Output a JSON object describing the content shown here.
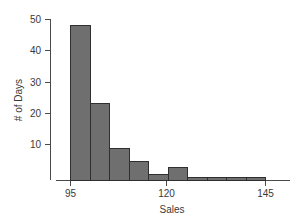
{
  "chart_data": {
    "type": "bar",
    "title": "",
    "xlabel": "Sales",
    "ylabel": "# of Days",
    "categories": [
      "95-100",
      "100-105",
      "105-110",
      "110-115",
      "115-120",
      "120-125",
      "125-130",
      "130-135",
      "135-140",
      "140-145"
    ],
    "bin_edges": [
      95,
      100,
      105,
      110,
      115,
      120,
      125,
      130,
      135,
      140,
      145
    ],
    "bin_width": 5,
    "values": [
      48,
      24,
      10,
      6,
      2,
      4,
      1,
      1,
      1,
      1
    ],
    "xlim": [
      95,
      145
    ],
    "ylim": [
      0,
      52
    ],
    "x_ticks": [
      95,
      120,
      145
    ],
    "x_tick_labels": [
      "95",
      "120",
      "145"
    ],
    "y_ticks": [
      10,
      20,
      30,
      40,
      50
    ],
    "y_tick_labels": [
      "10",
      "20",
      "30",
      "40",
      "50"
    ],
    "grid": false,
    "legend": "none",
    "bar_fill_color": "#6f6f6f",
    "bar_border_color": "#2f2f2f",
    "axis_color": "#4a4a4a",
    "background_color": "#ffffff"
  },
  "axis": {
    "x_title": "Sales",
    "y_title": "# of Days"
  },
  "y_tick_labels": {
    "t0": "10",
    "t1": "20",
    "t2": "30",
    "t3": "40",
    "t4": "50"
  },
  "x_tick_labels": {
    "t0": "95",
    "t1": "120",
    "t2": "145"
  }
}
